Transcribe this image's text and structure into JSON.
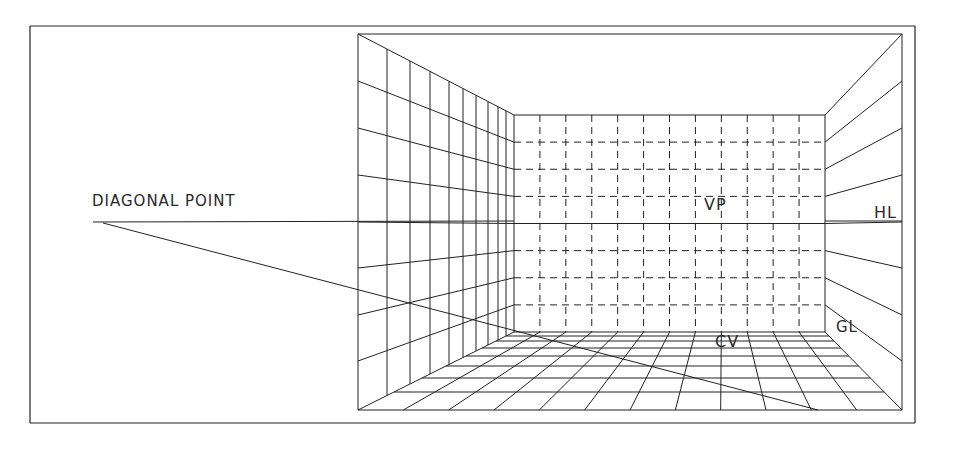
{
  "figure": {
    "stroke_color": "#222222",
    "background": "#ffffff"
  },
  "labels": {
    "diagonal_point": "DIAGONAL POINT",
    "vanishing_point": "VP",
    "horizon_line": "HL",
    "ground_line": "GL",
    "center_of_vision": "CV"
  },
  "geometry": {
    "frame": {
      "x1": 30,
      "y1": 26,
      "x2": 915,
      "y2": 423
    },
    "room_outer": {
      "x1": 358,
      "y1": 34,
      "x2": 902,
      "y2": 410
    },
    "back_wall": {
      "x1": 514,
      "y1": 115,
      "x2": 825,
      "y2": 332
    },
    "vanishing_point": {
      "x": 720,
      "y": 221
    },
    "horizon_y": 221,
    "diagonal_point": {
      "x": 93,
      "y": 223
    },
    "diagonal_end": {
      "x": 818,
      "y": 410
    },
    "back_wall_columns": 12,
    "back_wall_rows": 8,
    "left_wall_x": [
      358,
      387,
      410,
      430,
      449,
      463,
      476,
      488,
      498,
      506,
      514
    ],
    "left_wall_rows_outer_y": [
      34,
      81,
      128,
      175,
      222,
      268,
      315,
      361,
      410
    ],
    "floor_rows_y": [
      332,
      336,
      341,
      348,
      356,
      366,
      378,
      392,
      410
    ],
    "right_wall_outer_y": [
      34,
      81,
      128,
      175,
      222,
      268,
      315,
      361,
      410
    ]
  }
}
